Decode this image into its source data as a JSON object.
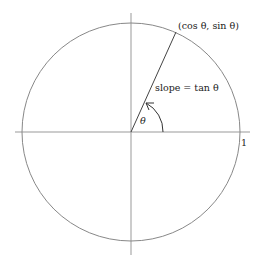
{
  "diagram": {
    "type": "unit-circle",
    "colors": {
      "line": "#888888",
      "ray": "#444444",
      "text": "#222222"
    },
    "labels": {
      "point": "(cos θ, sin θ)",
      "slope": "slope = tan θ",
      "angle": "θ",
      "one": "1"
    }
  }
}
